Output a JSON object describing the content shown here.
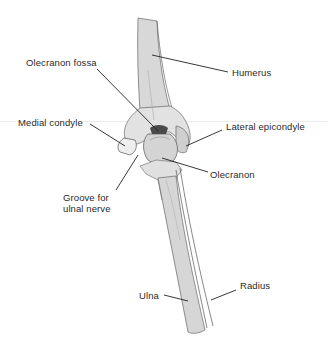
{
  "diagram": {
    "labels": [
      {
        "id": "olecranon-fossa",
        "text": "Olecranon fossa",
        "x": 26,
        "y": 58
      },
      {
        "id": "humerus",
        "text": "Humerus",
        "x": 232,
        "y": 68
      },
      {
        "id": "medial-condyle",
        "text": "Medial condyle",
        "x": 18,
        "y": 118
      },
      {
        "id": "lateral-epicondyle",
        "text": "Lateral epicondyle",
        "x": 226,
        "y": 122
      },
      {
        "id": "olecranon",
        "text": "Olecranon",
        "x": 210,
        "y": 170
      },
      {
        "id": "groove-line1",
        "text": "Groove for",
        "x": 63,
        "y": 193
      },
      {
        "id": "groove-line2",
        "text": "ulnal nerve",
        "x": 63,
        "y": 204
      },
      {
        "id": "ulna",
        "text": "Ulna",
        "x": 139,
        "y": 291
      },
      {
        "id": "radius",
        "text": "Radius",
        "x": 240,
        "y": 281
      }
    ],
    "colors": {
      "bone_fill": "#d6d6d6",
      "bone_light": "#e6e6e6",
      "bone_outline": "#555555",
      "fossa": "#4a4a4a",
      "leader_line": "#222222"
    }
  }
}
